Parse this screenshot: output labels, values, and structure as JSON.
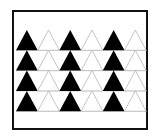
{
  "figure": {
    "rows": 4,
    "columns": 6,
    "pattern": [
      "black",
      "white",
      "black",
      "white",
      "black",
      "white"
    ],
    "colors": {
      "filled": "#000000",
      "outline": "#bdbdbd",
      "border": "#111111",
      "background": "#ffffff"
    },
    "counts": {
      "black_triangles": 12,
      "white_triangles": 12,
      "total": 24
    }
  }
}
